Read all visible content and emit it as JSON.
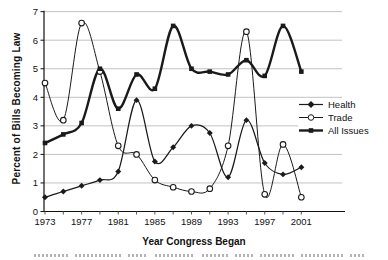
{
  "chart_data": {
    "type": "line",
    "title": "",
    "xlabel": "Year Congress Began",
    "ylabel": "Percent of Bills Becoming Law",
    "x": [
      1973,
      1975,
      1977,
      1979,
      1981,
      1983,
      1985,
      1987,
      1989,
      1991,
      1993,
      1995,
      1997,
      1999,
      2001
    ],
    "x_tick_labels": [
      "1973",
      "1977",
      "1981",
      "1985",
      "1989",
      "1993",
      "1997",
      "2001"
    ],
    "x_labeled_years": [
      1973,
      1977,
      1981,
      1985,
      1989,
      1993,
      1997,
      2001
    ],
    "y_ticks": [
      0,
      1,
      2,
      3,
      4,
      5,
      6,
      7
    ],
    "ylim": [
      0,
      7
    ],
    "grid": "horizontal",
    "legend_position": "right-middle",
    "line_color": "#1a1a1a",
    "grid_color": "#c2c2c2",
    "series": [
      {
        "name": "Health",
        "marker": "diamond-filled",
        "line_style": "thin",
        "values": [
          0.5,
          0.7,
          0.9,
          1.1,
          1.4,
          3.9,
          1.75,
          2.25,
          3.0,
          2.75,
          1.2,
          3.2,
          1.7,
          1.3,
          1.55
        ]
      },
      {
        "name": "Trade",
        "marker": "circle-open",
        "line_style": "thin",
        "values": [
          4.5,
          3.2,
          6.6,
          4.9,
          2.3,
          2.0,
          1.1,
          0.85,
          0.7,
          0.8,
          2.3,
          6.3,
          0.6,
          2.35,
          0.5
        ]
      },
      {
        "name": "All Issues",
        "marker": "square-filled",
        "line_style": "thick",
        "values": [
          2.4,
          2.7,
          3.1,
          5.0,
          3.6,
          4.8,
          4.3,
          6.5,
          5.0,
          4.9,
          4.8,
          5.3,
          4.75,
          6.5,
          4.9
        ]
      }
    ]
  }
}
